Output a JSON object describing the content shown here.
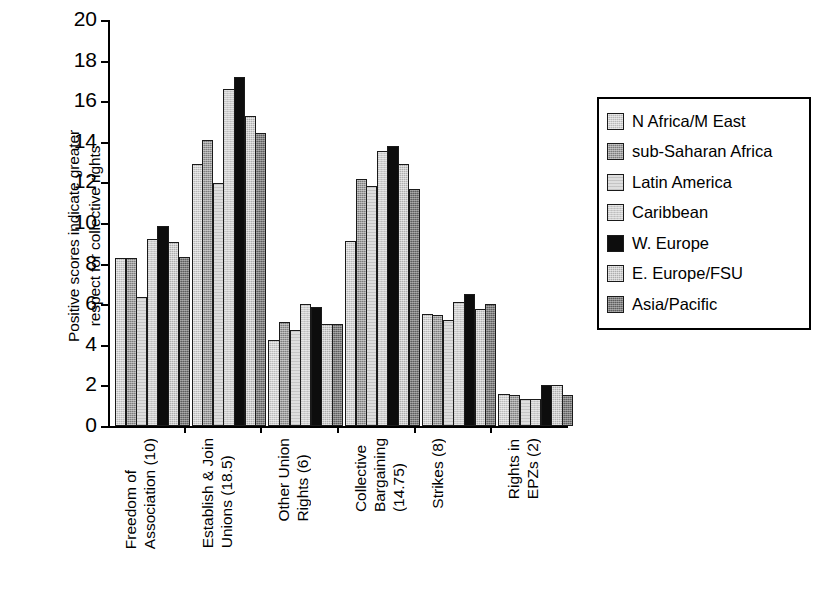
{
  "chart_data": {
    "type": "bar",
    "title": "",
    "xlabel": "",
    "ylabel": "Positive scores indicate greater\nrespect for collective rights",
    "ylim": [
      0,
      20
    ],
    "yticks": [
      0,
      2,
      4,
      6,
      8,
      10,
      12,
      14,
      16,
      18,
      20
    ],
    "ytick_labels": [
      "0",
      "2",
      "4",
      "6",
      "8",
      "10",
      "12",
      "14",
      "16",
      "18",
      "20"
    ],
    "grid": false,
    "legend_position": "right",
    "categories": [
      "Freedom of\nAssociation (10)",
      "Establish & Join\nUnions (18.5)",
      "Other Union\nRights (6)",
      "Collective\nBargaining\n(14.75)",
      "Strikes (8)",
      "Rights in\nEPZs (2)"
    ],
    "series": [
      {
        "name": "N Africa/M East",
        "color": "#b9b9b9",
        "fill": "f0",
        "values": [
          8.3,
          12.9,
          4.25,
          9.1,
          5.5,
          1.6
        ]
      },
      {
        "name": "sub-Saharan Africa",
        "color": "#7d7d7d",
        "fill": "f1",
        "values": [
          8.3,
          14.1,
          5.1,
          12.15,
          5.45,
          1.55
        ]
      },
      {
        "name": "Latin America",
        "color": "#dedede",
        "fill": "f2",
        "values": [
          6.35,
          11.95,
          4.75,
          11.8,
          5.2,
          1.35
        ]
      },
      {
        "name": "Caribbean",
        "color": "#cccccc",
        "fill": "f3",
        "values": [
          9.2,
          16.6,
          6.0,
          13.55,
          6.1,
          1.35
        ]
      },
      {
        "name": "W. Europe",
        "color": "#0d0d0d",
        "fill": "f4",
        "values": [
          9.85,
          17.2,
          5.85,
          13.8,
          6.5,
          2.0
        ]
      },
      {
        "name": "E. Europe/FSU",
        "color": "#aeaeae",
        "fill": "f5",
        "values": [
          9.05,
          15.25,
          5.05,
          12.9,
          5.75,
          2.0
        ]
      },
      {
        "name": "Asia/Pacific",
        "color": "#5e5e5e",
        "fill": "f6",
        "values": [
          8.35,
          14.45,
          5.05,
          11.7,
          6.0,
          1.55
        ]
      }
    ]
  }
}
